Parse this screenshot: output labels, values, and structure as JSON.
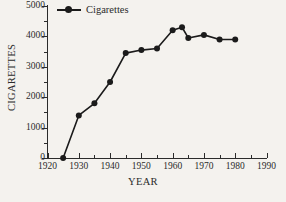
{
  "chart_data": {
    "type": "line",
    "title": "",
    "xlabel": "YEAR",
    "ylabel": "CIGARETTES",
    "xlim": [
      1920,
      1990
    ],
    "ylim": [
      0,
      5000
    ],
    "grid": false,
    "legend_position": "top-left",
    "legend": [
      "Cigarettes"
    ],
    "x_ticks": [
      1920,
      1930,
      1940,
      1950,
      1960,
      1970,
      1980,
      1990
    ],
    "x_tick_labels": [
      "1920",
      "1930",
      "1940",
      "1950",
      "1960",
      "1970",
      "1980",
      "1990"
    ],
    "x_minor_ticks": [
      1925,
      1935,
      1945,
      1955,
      1965,
      1975,
      1985
    ],
    "y_ticks": [
      0,
      1000,
      2000,
      3000,
      4000,
      5000
    ],
    "y_tick_labels": [
      "0",
      "1000",
      "2000",
      "3000",
      "4000",
      "5000"
    ],
    "y_minor_ticks": [
      500,
      1500,
      2500,
      3500,
      4500
    ],
    "series": [
      {
        "name": "Cigarettes",
        "color": "#1b1b1b",
        "marker": "circle",
        "x": [
          1925,
          1930,
          1935,
          1940,
          1945,
          1950,
          1955,
          1960,
          1963,
          1965,
          1970,
          1975,
          1980
        ],
        "values": [
          0,
          1400,
          1800,
          2500,
          3450,
          3550,
          3600,
          4200,
          4300,
          3950,
          4050,
          3900,
          3900
        ]
      }
    ]
  },
  "axes": {
    "x_title": "YEAR",
    "y_title": "CIGARETTES"
  },
  "legend": {
    "entries": [
      {
        "label": "Cigarettes",
        "color": "#1b1b1b"
      }
    ]
  }
}
